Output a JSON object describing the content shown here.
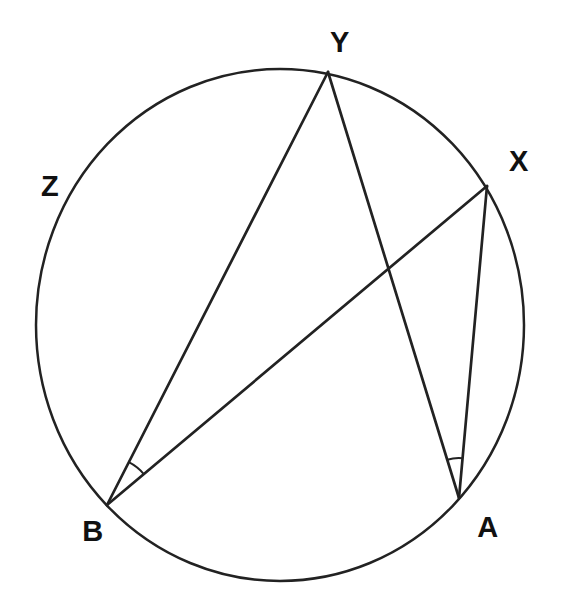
{
  "figure": {
    "kind": "circle-inscribed-angles-diagram",
    "background": "#ffffff",
    "stroke_color": "#222222",
    "label_color": "#111111",
    "circle": {
      "cx": 280,
      "cy": 325,
      "rx": 244,
      "ry": 256,
      "stroke_width": 2.5
    },
    "points": {
      "Y": {
        "x": 328,
        "y": 72
      },
      "X": {
        "x": 487,
        "y": 186
      },
      "B": {
        "x": 107,
        "y": 505
      },
      "A": {
        "x": 459,
        "y": 498
      }
    },
    "chord_stroke_width": 2.7,
    "chords": [
      {
        "from": "B",
        "to": "Y"
      },
      {
        "from": "B",
        "to": "X"
      },
      {
        "from": "A",
        "to": "Y"
      },
      {
        "from": "A",
        "to": "X"
      }
    ],
    "angle_marks": [
      {
        "vertex": "B",
        "radius": 48,
        "start_deg": -63,
        "end_deg": -40,
        "stroke_width": 2
      },
      {
        "vertex": "A",
        "radius": 40,
        "start_deg": -107,
        "end_deg": -85,
        "stroke_width": 2
      }
    ],
    "labels": [
      {
        "text": "Y",
        "x": 340,
        "y": 52
      },
      {
        "text": "X",
        "x": 519,
        "y": 171
      },
      {
        "text": "Z",
        "x": 50,
        "y": 196
      },
      {
        "text": "B",
        "x": 93,
        "y": 541
      },
      {
        "text": "A",
        "x": 488,
        "y": 537
      }
    ]
  }
}
